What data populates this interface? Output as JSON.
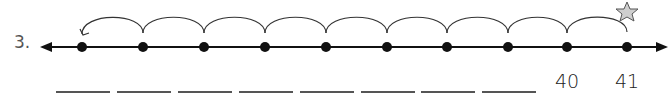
{
  "problem": {
    "number": "3.",
    "points_x": [
      82,
      143,
      204,
      265,
      326,
      387,
      447,
      508,
      567,
      627
    ],
    "labels": [
      "",
      "",
      "",
      "",
      "",
      "",
      "",
      "",
      "40",
      "41"
    ],
    "start_marker": "star",
    "jump_direction": "left",
    "jumps": 9,
    "colors": {
      "line": "#111111",
      "star_fill": "#cfcfcf",
      "star_stroke": "#555555"
    }
  }
}
